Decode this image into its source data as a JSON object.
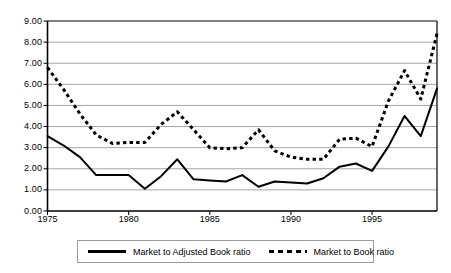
{
  "chart_data": {
    "type": "line",
    "title": "",
    "xlabel": "",
    "ylabel": "",
    "xlim": [
      1975,
      1999
    ],
    "ylim": [
      0.0,
      9.0
    ],
    "ytick_step": 1.0,
    "grid": "horizontal",
    "legend_position": "bottom",
    "ytick_labels": [
      "9.00",
      "8.00",
      "7.00",
      "6.00",
      "5.00",
      "4.00",
      "3.00",
      "2.00",
      "1.00",
      "0.00"
    ],
    "ytick_values": [
      9,
      8,
      7,
      6,
      5,
      4,
      3,
      2,
      1,
      0
    ],
    "xtick_labels": [
      "1975",
      "1980",
      "1985",
      "1990",
      "1995"
    ],
    "xtick_values": [
      1975,
      1980,
      1985,
      1990,
      1995
    ],
    "x": [
      1975,
      1976,
      1977,
      1978,
      1979,
      1980,
      1981,
      1982,
      1983,
      1984,
      1985,
      1986,
      1987,
      1988,
      1989,
      1990,
      1991,
      1992,
      1993,
      1994,
      1995,
      1996,
      1997,
      1998,
      1999
    ],
    "series": [
      {
        "name": "Market to Adjusted Book ratio",
        "style": "solid",
        "color": "#000000",
        "values": [
          3.55,
          3.1,
          2.55,
          1.7,
          1.7,
          1.7,
          1.05,
          1.65,
          2.45,
          1.5,
          1.45,
          1.4,
          1.7,
          1.15,
          1.4,
          1.35,
          1.3,
          1.55,
          2.1,
          2.25,
          1.9,
          3.05,
          4.5,
          3.55,
          5.8
        ]
      },
      {
        "name": "Market to Book ratio",
        "style": "dashed",
        "color": "#000000",
        "values": [
          6.8,
          5.75,
          4.6,
          3.6,
          3.2,
          3.25,
          3.25,
          4.1,
          4.7,
          3.85,
          3.0,
          2.95,
          3.0,
          3.85,
          2.85,
          2.55,
          2.45,
          2.45,
          3.4,
          3.45,
          3.05,
          5.2,
          6.65,
          5.3,
          8.4
        ]
      }
    ]
  },
  "legend": {
    "entries": [
      {
        "label": "Market to Adjusted Book ratio",
        "style": "solid"
      },
      {
        "label": "Market to Book ratio",
        "style": "dashed"
      }
    ]
  },
  "colors": {
    "line": "#000000",
    "grid": "#a6a6a6",
    "axis": "#000000",
    "background": "#ffffff",
    "legend_border": "#9a9a9a"
  }
}
